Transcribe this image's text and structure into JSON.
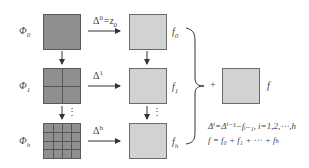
{
  "rows": [
    {
      "phi_label": "Φ",
      "phi_sub": "0",
      "grid": 1,
      "arrow_label": "Δ",
      "arrow_sup": "0",
      "arrow_suffix": "=z",
      "arrow_suffix_sub": "0",
      "f_label": "f",
      "f_sub": "0"
    },
    {
      "phi_label": "Φ",
      "phi_sub": "1",
      "grid": 2,
      "arrow_label": "Δ",
      "arrow_sup": "1",
      "arrow_suffix": "",
      "arrow_suffix_sub": "",
      "f_label": "f",
      "f_sub": "1"
    },
    {
      "phi_label": "Φ",
      "phi_sub": "h",
      "grid": 4,
      "arrow_label": "Δ",
      "arrow_sup": "h",
      "arrow_suffix": "",
      "arrow_suffix_sub": "",
      "f_label": "f",
      "f_sub": "h"
    }
  ],
  "ellipsis": "⋮",
  "plus": "+",
  "result_label": "f",
  "equations": {
    "line1": "Δⁱ=Δⁱ⁻¹−fᵢ₋₁, i=1,2,⋯,h",
    "line2": "f = f₀ + f₁ + ⋯ + fₕ"
  },
  "colors": {
    "phi_fill": "#8f8f8f",
    "f_fill": "#d2d2d2",
    "line": "#333333"
  }
}
